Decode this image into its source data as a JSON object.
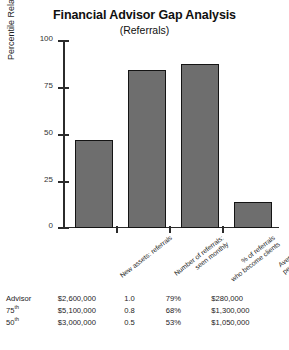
{
  "chart_data": {
    "type": "bar",
    "title": "Financial Advisor Gap Analysis",
    "subtitle": "(Referrals)",
    "xlabel": "",
    "ylabel": "Percentile Relative to Benchmark",
    "ylim": [
      0,
      100
    ],
    "yticks": [
      0,
      25,
      50,
      75,
      100
    ],
    "ytick_labels": [
      "0",
      "25",
      "50",
      "75",
      "100"
    ],
    "grid": false,
    "legend": "none",
    "categories": [
      "New assets: referrals",
      "Number of referrals seen monthly",
      "% of referrals who become clients",
      "Average assets per new referral"
    ],
    "category_lines": [
      [
        "New assets: referrals"
      ],
      [
        "Number of referrals:",
        "seen monthly"
      ],
      [
        "% of referrals",
        "who become clients"
      ],
      [
        "Average assets",
        "per new referral"
      ]
    ],
    "values": [
      47,
      84,
      87,
      14
    ],
    "bar_fill_color": "#6e6e6e",
    "bar_edge_color": "#141414"
  },
  "table": {
    "row_labels": [
      {
        "text": "Advisor",
        "sup": ""
      },
      {
        "text": "75",
        "sup": "th"
      },
      {
        "text": "50",
        "sup": "th"
      }
    ],
    "rows": [
      [
        "$2,600,000",
        "1.0",
        "79%",
        "$280,000"
      ],
      [
        "$5,100,000",
        "0.8",
        "68%",
        "$1,300,000"
      ],
      [
        "$3,000,000",
        "0.5",
        "53%",
        "$1,050,000"
      ]
    ]
  }
}
